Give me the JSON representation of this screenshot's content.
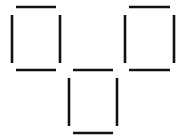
{
  "puzzle": {
    "type": "matchstick-arrangement",
    "stick_count": 12,
    "square_count": 3,
    "stick_color": "#111111",
    "background_color": "#ffffff",
    "squares": [
      {
        "name": "left-square",
        "sticks": [
          "top",
          "left",
          "right",
          "bottom"
        ]
      },
      {
        "name": "middle-square",
        "sticks": [
          "top",
          "left",
          "right",
          "bottom"
        ]
      },
      {
        "name": "right-square",
        "sticks": [
          "top",
          "left",
          "right",
          "bottom"
        ]
      }
    ]
  }
}
